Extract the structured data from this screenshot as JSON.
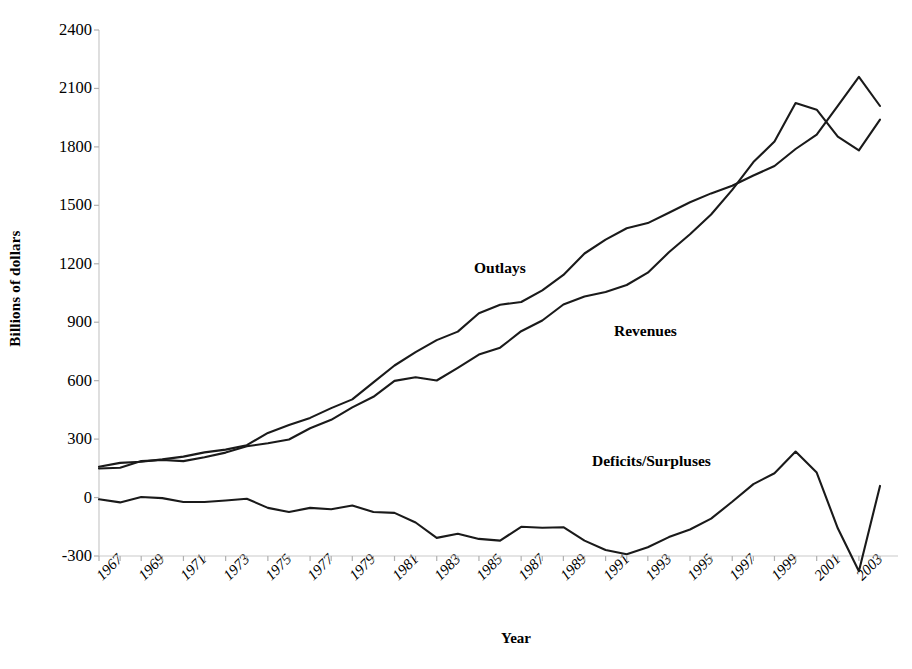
{
  "chart": {
    "type": "line",
    "title": "",
    "xlabel": "Year",
    "ylabel": "Billions of dollars"
  },
  "axes": {
    "y_ticks": [
      "2400",
      "2100",
      "1800",
      "1500",
      "1200",
      "900",
      "600",
      "300",
      "0",
      "-300"
    ],
    "x_ticks": [
      "1967",
      "1969",
      "1971",
      "1973",
      "1975",
      "1977",
      "1979",
      "1981",
      "1983",
      "1985",
      "1987",
      "1989",
      "1991",
      "1993",
      "1995",
      "1997",
      "1999",
      "2001",
      "2003"
    ]
  },
  "annotations": {
    "outlays": "Outlays",
    "revenues": "Revenues",
    "deficits": "Deficits/Surpluses"
  },
  "chart_data": {
    "type": "line",
    "title": "",
    "xlabel": "Year",
    "ylabel": "Billions of dollars",
    "xlim": [
      1967,
      2004
    ],
    "ylim": [
      -300,
      2400
    ],
    "ytick_values": [
      2400,
      2100,
      1800,
      1500,
      1200,
      900,
      600,
      300,
      0,
      -300
    ],
    "xtick_values": [
      1967,
      1969,
      1971,
      1973,
      1975,
      1977,
      1979,
      1981,
      1983,
      1985,
      1987,
      1989,
      1991,
      1993,
      1995,
      1997,
      1999,
      2001,
      2003
    ],
    "grid": false,
    "legend": "inline-annotations",
    "x": [
      1967,
      1968,
      1969,
      1970,
      1971,
      1972,
      1973,
      1974,
      1975,
      1976,
      1977,
      1978,
      1979,
      1980,
      1981,
      1982,
      1983,
      1984,
      1985,
      1986,
      1987,
      1988,
      1989,
      1990,
      1991,
      1992,
      1993,
      1994,
      1995,
      1996,
      1997,
      1998,
      1999,
      2000,
      2001,
      2002,
      2003,
      2004
    ],
    "series": [
      {
        "name": "Outlays",
        "color": "#1a1a1a",
        "values": [
          158,
          178,
          184,
          196,
          210,
          232,
          246,
          269,
          332,
          372,
          409,
          459,
          504,
          591,
          678,
          746,
          808,
          852,
          946,
          990,
          1004,
          1064,
          1143,
          1253,
          1324,
          1382,
          1409,
          1462,
          1516,
          1561,
          1601,
          1653,
          1702,
          1789,
          1863,
          2011,
          2160,
          2010
        ]
      },
      {
        "name": "Revenues",
        "color": "#1a1a1a",
        "values": [
          149,
          153,
          187,
          193,
          187,
          207,
          231,
          263,
          279,
          298,
          356,
          399,
          463,
          517,
          599,
          618,
          601,
          666,
          734,
          769,
          854,
          909,
          991,
          1032,
          1055,
          1091,
          1154,
          1259,
          1352,
          1453,
          1579,
          1722,
          1827,
          2025,
          1991,
          1853,
          1782,
          1940
        ]
      },
      {
        "name": "Deficits/Surpluses",
        "color": "#1a1a1a",
        "values": [
          -9,
          -25,
          3,
          -3,
          -23,
          -23,
          -15,
          -6,
          -53,
          -74,
          -53,
          -60,
          -41,
          -74,
          -79,
          -128,
          -207,
          -186,
          -212,
          -221,
          -150,
          -155,
          -152,
          -221,
          -269,
          -291,
          -255,
          -203,
          -164,
          -108,
          -22,
          69,
          125,
          236,
          128,
          -158,
          -378,
          60
        ]
      }
    ]
  }
}
